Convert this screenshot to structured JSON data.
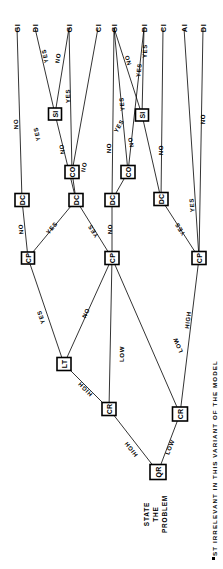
{
  "diagram": {
    "orientation": "rotated-90-ccw",
    "root_caption_lines": [
      "STATE",
      "THE",
      "PROBLEM"
    ],
    "footnote": "ST IRRELEVANT IN THIS VARIANT OF THE MODEL",
    "footnote_marker": "▪",
    "stroke_color": "#000000",
    "background_color": "#ffffff"
  },
  "nodes": [
    {
      "id": "QR",
      "label": "QR",
      "x": 158,
      "y": 472,
      "w": 16,
      "h": 15
    },
    {
      "id": "CR1",
      "label": "CR",
      "x": 109,
      "y": 409,
      "w": 14,
      "h": 13
    },
    {
      "id": "CR2",
      "label": "CR",
      "x": 180,
      "y": 414,
      "w": 15,
      "h": 14
    },
    {
      "id": "LT",
      "label": "LT",
      "x": 64,
      "y": 364,
      "w": 14,
      "h": 13
    },
    {
      "id": "CP1",
      "label": "CP",
      "x": 28,
      "y": 258,
      "w": 13,
      "h": 12
    },
    {
      "id": "CP2",
      "label": "CP",
      "x": 112,
      "y": 258,
      "w": 14,
      "h": 13
    },
    {
      "id": "CP3",
      "label": "CP",
      "x": 199,
      "y": 258,
      "w": 14,
      "h": 13
    },
    {
      "id": "DC1",
      "label": "DC",
      "x": 22,
      "y": 200,
      "w": 14,
      "h": 13
    },
    {
      "id": "DC2",
      "label": "DC",
      "x": 76,
      "y": 200,
      "w": 14,
      "h": 13
    },
    {
      "id": "DC3",
      "label": "DC",
      "x": 112,
      "y": 200,
      "w": 14,
      "h": 13
    },
    {
      "id": "DC4",
      "label": "DC",
      "x": 161,
      "y": 199,
      "w": 14,
      "h": 13
    },
    {
      "id": "SI1",
      "label": "SI",
      "x": 55,
      "y": 114,
      "w": 13,
      "h": 12
    },
    {
      "id": "CO1",
      "label": "CO",
      "x": 72,
      "y": 172,
      "w": 14,
      "h": 13
    },
    {
      "id": "SI2",
      "label": "SI",
      "x": 142,
      "y": 115,
      "w": 13,
      "h": 12
    },
    {
      "id": "CO2",
      "label": "CO",
      "x": 128,
      "y": 172,
      "w": 14,
      "h": 13
    }
  ],
  "leaves": [
    {
      "id": "L1",
      "label": "GI",
      "x": 17,
      "y": 28
    },
    {
      "id": "L2",
      "label": "DI",
      "x": 35,
      "y": 28
    },
    {
      "id": "L3",
      "label": "GI",
      "x": 69,
      "y": 28
    },
    {
      "id": "L4",
      "label": "CI",
      "x": 98,
      "y": 28
    },
    {
      "id": "L5",
      "label": "GI",
      "x": 114,
      "y": 28
    },
    {
      "id": "L6",
      "label": "DI",
      "x": 144,
      "y": 28
    },
    {
      "id": "L7",
      "label": "CI",
      "x": 163,
      "y": 28
    },
    {
      "id": "L8",
      "label": "AI",
      "x": 184,
      "y": 28
    },
    {
      "id": "L9",
      "label": "DI",
      "x": 203,
      "y": 28
    }
  ],
  "edges": [
    {
      "from": "QR",
      "to": "CR1",
      "label": "HIGH",
      "lx": 131,
      "ly": 449
    },
    {
      "from": "QR",
      "to": "CR2",
      "label": "LOW",
      "lx": 170,
      "ly": 447
    },
    {
      "from": "CR1",
      "to": "LT",
      "label": "HIGH",
      "lx": 85,
      "ly": 389
    },
    {
      "from": "CR1",
      "to": "CP2",
      "label": "LOW",
      "lx": 122,
      "ly": 354
    },
    {
      "from": "CR2",
      "to": "CP3",
      "label": "HIGH",
      "lx": 188,
      "ly": 320
    },
    {
      "from": "CR2",
      "to": "CP2",
      "label": "LOW",
      "lx": 178,
      "ly": 345
    },
    {
      "from": "LT",
      "to": "CP1",
      "label": "YES",
      "lx": 41,
      "ly": 317
    },
    {
      "from": "LT",
      "to": "CP2",
      "label": "NO",
      "lx": 86,
      "ly": 313
    },
    {
      "from": "CP1",
      "to": "DC1",
      "label": "NO",
      "lx": 21,
      "ly": 229
    },
    {
      "from": "CP1",
      "to": "DC2",
      "label": "YES",
      "lx": 52,
      "ly": 228
    },
    {
      "from": "CP2",
      "to": "DC2",
      "label": "YES",
      "lx": 93,
      "ly": 231
    },
    {
      "from": "CP2",
      "to": "DC3",
      "label": "NO",
      "lx": 110,
      "ly": 229
    },
    {
      "from": "CP3",
      "to": "DC4",
      "label": "YES",
      "lx": 180,
      "ly": 229
    },
    {
      "from": "DC1",
      "to": "L1",
      "label": "NO",
      "lx": 16,
      "ly": 124
    },
    {
      "from": "DC2",
      "to": "SI1",
      "label": "YES",
      "lx": 37,
      "ly": 134
    },
    {
      "from": "DC2",
      "to": "CO1",
      "label": "NO",
      "lx": 62,
      "ly": 149
    },
    {
      "from": "SI1",
      "to": "L2",
      "label": "YES",
      "lx": 45,
      "ly": 56
    },
    {
      "from": "SI1",
      "to": "L3",
      "label": "NO",
      "lx": 58,
      "ly": 58
    },
    {
      "from": "CO1",
      "to": "L3",
      "label": "YES",
      "lx": 68,
      "ly": 96
    },
    {
      "from": "CO1",
      "to": "L4",
      "label": "NO",
      "lx": 84,
      "ly": 167
    },
    {
      "from": "DC3",
      "to": "CO2",
      "label": "YES",
      "lx": 119,
      "ly": 126
    },
    {
      "from": "DC3",
      "to": "L5",
      "label": "NO",
      "lx": 109,
      "ly": 148
    },
    {
      "from": "DC4",
      "to": "SI2",
      "label": "NO",
      "lx": 131,
      "ly": 142
    },
    {
      "from": "CO2",
      "to": "L5",
      "label": "YES",
      "lx": 122,
      "ly": 104
    },
    {
      "from": "CO2",
      "to": "L6",
      "label": "YES",
      "lx": 139,
      "ly": 70
    },
    {
      "from": "SI2",
      "to": "L5",
      "label": "NO",
      "lx": 128,
      "ly": 60
    },
    {
      "from": "SI2",
      "to": "L6",
      "label": "YES",
      "lx": 145,
      "ly": 51
    },
    {
      "from": "DC4",
      "to": "L7",
      "label": "NO",
      "lx": 161,
      "ly": 150
    },
    {
      "from": "CP3",
      "to": "L8",
      "label": "YES",
      "lx": 192,
      "ly": 205
    },
    {
      "from": "CP3",
      "to": "L9",
      "label": "NO",
      "lx": 203,
      "ly": 119
    }
  ]
}
